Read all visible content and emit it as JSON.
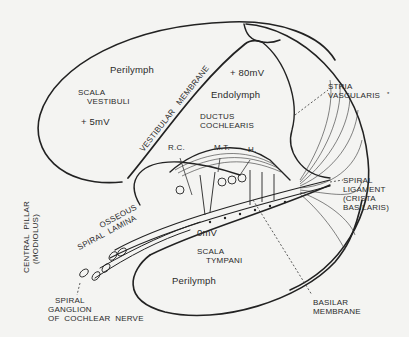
{
  "diagram": {
    "type": "cross-section of cochlear duct",
    "colors": {
      "ink": "#222222",
      "background": "#f4f4f2"
    },
    "regions": {
      "scala_vestibuli": {
        "fluid": "Perilymph",
        "name_line1": "SCALA",
        "name_line2": "VESTIBULI",
        "potential": "+ 5mV"
      },
      "ductus_cochlearis": {
        "fluid": "Endolymph",
        "name_line1": "DUCTUS",
        "name_line2": "COCHLEARIS",
        "potential": "+ 80mV"
      },
      "scala_tympani": {
        "fluid": "Perilymph",
        "name_line1": "SCALA",
        "name_line2": "TYMPANI",
        "potential": "0mV"
      }
    },
    "labels": {
      "vestibular_membrane": "VESTIBULAR   MEMBRANE",
      "rc": "R.C.",
      "mt": "M.T.",
      "h": "H.",
      "stria_line1": "STRIA",
      "stria_line2": "VASCULARIS",
      "stria_mark": "*",
      "spiral_lig_line1": "SPIRAL",
      "spiral_lig_line2": "LIGAMENT",
      "spiral_lig_line3": "(CRISTA",
      "spiral_lig_line4": "BASILARIS)",
      "osseous_line1": "OSSEOUS",
      "osseous_line2": "SPIRAL  LAMINA",
      "central_line1": "CENTRAL  PILLAR",
      "central_line2": "(MODIOLUS)",
      "ganglion_line1": "SPIRAL",
      "ganglion_line2": "GANGLION",
      "ganglion_line3": "OF  COCHLEAR  NERVE",
      "basilar_line1": "BASILAR",
      "basilar_line2": "MEMBRANE"
    }
  }
}
